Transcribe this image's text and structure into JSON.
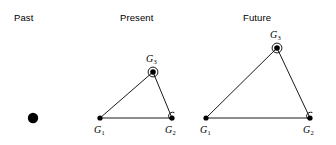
{
  "figure": {
    "width": 336,
    "height": 145,
    "background": "#ffffff",
    "stroke_color": "#1a1a1a",
    "marker_color": "#000000"
  },
  "panels": [
    {
      "key": "past",
      "title": "Past",
      "title_x": 14,
      "title_y": 12,
      "nodes": [
        {
          "id": "past-dot",
          "label": "",
          "sub": "",
          "x": 33,
          "y": 118,
          "radius": 5.2,
          "halo": false,
          "hook": false,
          "label_x": 0,
          "label_y": 0
        }
      ],
      "edges": []
    },
    {
      "key": "present",
      "title": "Present",
      "title_x": 120,
      "title_y": 12,
      "nodes": [
        {
          "id": "present-g1",
          "label": "G",
          "sub": "1",
          "x": 100,
          "y": 118,
          "radius": 2.6,
          "halo": false,
          "hook": false,
          "label_x": 94,
          "label_y": 124
        },
        {
          "id": "present-g2",
          "label": "G",
          "sub": "2",
          "x": 172,
          "y": 118,
          "radius": 2.6,
          "halo": false,
          "hook": true,
          "label_x": 165,
          "label_y": 124
        },
        {
          "id": "present-g3",
          "label": "G",
          "sub": "3",
          "x": 153,
          "y": 72,
          "radius": 2.8,
          "halo": true,
          "hook": false,
          "label_x": 146,
          "label_y": 53
        }
      ],
      "edges": [
        {
          "from": "present-g1",
          "to": "present-g2"
        },
        {
          "from": "present-g1",
          "to": "present-g3"
        },
        {
          "from": "present-g3",
          "to": "present-g2"
        }
      ]
    },
    {
      "key": "future",
      "title": "Future",
      "title_x": 243,
      "title_y": 12,
      "nodes": [
        {
          "id": "future-g1",
          "label": "G",
          "sub": "1",
          "x": 206,
          "y": 118,
          "radius": 2.6,
          "halo": false,
          "hook": false,
          "label_x": 200,
          "label_y": 124
        },
        {
          "id": "future-g2",
          "label": "G",
          "sub": "2",
          "x": 310,
          "y": 118,
          "radius": 2.6,
          "halo": false,
          "hook": true,
          "label_x": 303,
          "label_y": 124
        },
        {
          "id": "future-g3",
          "label": "G",
          "sub": "3",
          "x": 277,
          "y": 48,
          "radius": 2.8,
          "halo": true,
          "hook": false,
          "label_x": 270,
          "label_y": 29
        }
      ],
      "edges": [
        {
          "from": "future-g1",
          "to": "future-g2"
        },
        {
          "from": "future-g1",
          "to": "future-g3"
        },
        {
          "from": "future-g3",
          "to": "future-g2"
        }
      ]
    }
  ]
}
